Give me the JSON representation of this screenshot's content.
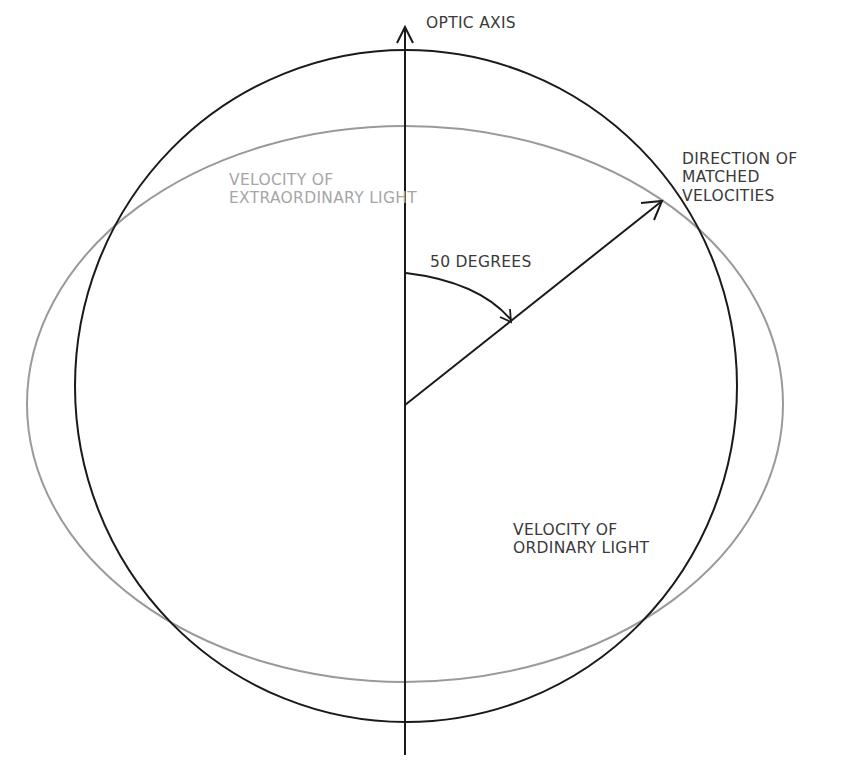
{
  "diagram": {
    "labels": {
      "optic_axis": "OPTIC AXIS",
      "extraordinary_line1": "VELOCITY OF",
      "extraordinary_line2": "EXTRAORDINARY LIGHT",
      "matched_line1": "DIRECTION OF",
      "matched_line2": "MATCHED",
      "matched_line3": "VELOCITIES",
      "angle": "50 DEGREES",
      "ordinary_line1": "VELOCITY OF",
      "ordinary_line2": "ORDINARY LIGHT"
    },
    "angle_degrees": 50,
    "colors": {
      "ordinary_circle": "#1a1a1a",
      "extraordinary_ellipse": "#9a9a9a",
      "axis": "#1a1a1a",
      "text_dark": "#3a3a3a",
      "text_gray": "#a6a6a6"
    }
  }
}
